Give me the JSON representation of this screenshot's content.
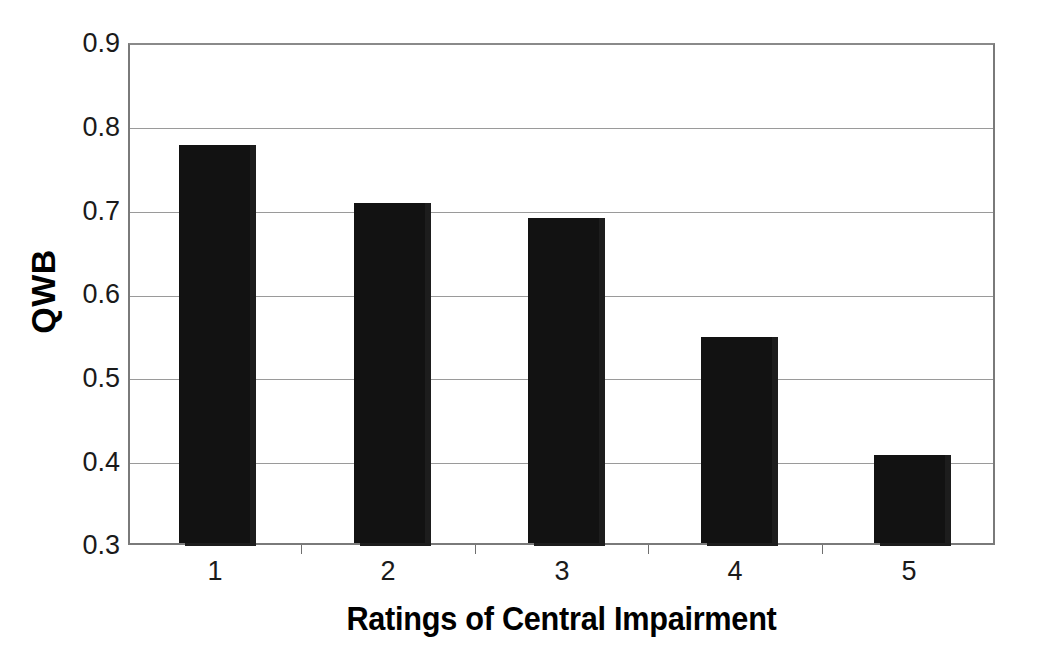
{
  "chart_data": {
    "type": "bar",
    "title": "",
    "categories": [
      "1",
      "2",
      "3",
      "4",
      "5"
    ],
    "values": [
      0.78,
      0.71,
      0.692,
      0.548,
      0.406
    ],
    "xlabel": "Ratings of Central Impairment",
    "ylabel": "QWB",
    "ylim": [
      0.3,
      0.9
    ],
    "ytick_values": [
      0.3,
      0.4,
      0.5,
      0.6,
      0.7,
      0.8,
      0.9
    ],
    "ytick_labels": [
      "0.3",
      "0.4",
      "0.5",
      "0.6",
      "0.7",
      "0.8",
      "0.9"
    ],
    "grid": true,
    "grid_axis": "y",
    "legend": false,
    "legend_position": "none",
    "bar_color": "#121212",
    "grid_color": "#9a9a9a",
    "axis_color": "#7a7a7a",
    "background_color": "#ffffff"
  }
}
